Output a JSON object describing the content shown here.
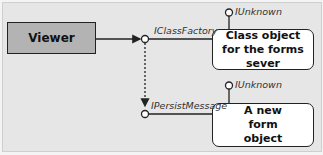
{
  "diagram": {
    "viewer": {
      "label": "Viewer"
    },
    "class_object": {
      "label": "Class object for the forms sever"
    },
    "new_form": {
      "label": "A new form object"
    },
    "interfaces": {
      "iclassfactory": "IClassFactory",
      "ipersistmessage": "IPersistMessage",
      "iunknown_top": "IUnknown",
      "iunknown_bottom": "IUnknown"
    },
    "colors": {
      "viewer_fill": "#b3b3b3",
      "box_fill": "#ffffff",
      "line": "#222222",
      "background": "#e6e6e6"
    }
  }
}
